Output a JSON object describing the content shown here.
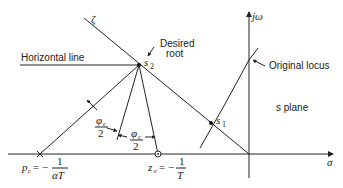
{
  "diagram": {
    "axes": {
      "x_label": "σ",
      "y_label": "jω",
      "plane_label": "s plane"
    },
    "labels": {
      "zeta": "ζ",
      "horizontal_line": "Horizontal line",
      "desired_root_line1": "Desired",
      "desired_root_line2": "root",
      "s2": "s",
      "s2_sub": "2",
      "s1": "s",
      "s1_sub": "1",
      "original_locus": "Original locus",
      "phi_num": "φ",
      "phi_sub": "c",
      "phi_den": "2",
      "pole_label_lhs": "p",
      "pole_label_sub": "c",
      "pole_label_eq": "= −",
      "pole_num": "1",
      "pole_den": "αT",
      "zero_label_lhs": "z",
      "zero_label_sub": "c",
      "zero_label_eq": "= −",
      "zero_num": "1",
      "zero_den": "T"
    },
    "points": {
      "origin": [
        249,
        154
      ],
      "s2": [
        139,
        65
      ],
      "s1": [
        211,
        123
      ],
      "pole_pc": [
        40,
        154
      ],
      "zero_zc": [
        158,
        154
      ]
    }
  }
}
